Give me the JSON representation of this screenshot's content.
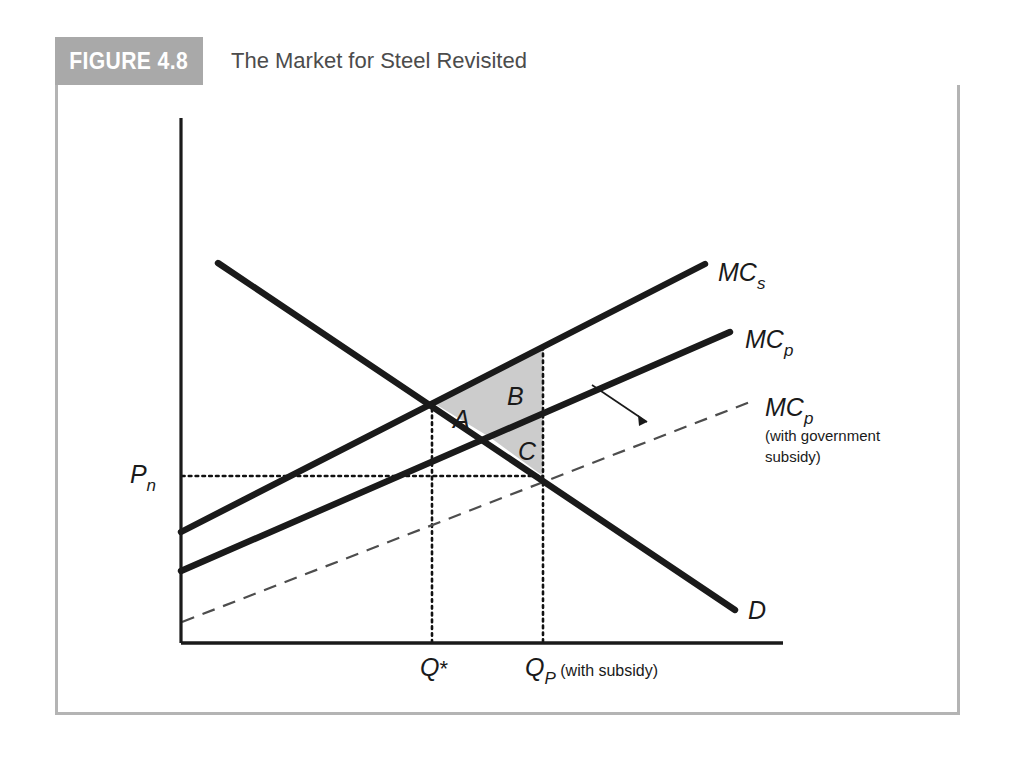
{
  "figure": {
    "number_label": "FIGURE 4.8",
    "title": "The Market for Steel Revisited"
  },
  "colors": {
    "header_box": "#a9a9a9",
    "title_text": "#4c4c4c",
    "frame_border": "#b4b4b4",
    "curve": "#1a1a1a",
    "shaded_region": "#cccccc",
    "dashed_curve": "#555555"
  },
  "axes": {
    "y_axis_label": "",
    "x_axis_label": "",
    "price_tick": {
      "label": "P",
      "subscript": "n"
    },
    "quantity_ticks": [
      {
        "label": "Q",
        "superscript": "*",
        "subscript": "",
        "note": ""
      },
      {
        "label": "Q",
        "superscript": "",
        "subscript": "P",
        "note": "(with subsidy)"
      }
    ]
  },
  "curves": [
    {
      "name": "marginal-social-cost",
      "label": "MC",
      "subscript": "s",
      "style": "solid",
      "note": ""
    },
    {
      "name": "marginal-private-cost",
      "label": "MC",
      "subscript": "p",
      "style": "solid",
      "note": ""
    },
    {
      "name": "marginal-private-cost-with-subsidy",
      "label": "MC",
      "subscript": "p",
      "style": "dashed",
      "note_line1": "(with government",
      "note_line2": "subsidy)"
    },
    {
      "name": "demand",
      "label": "D",
      "subscript": "",
      "style": "solid",
      "note": ""
    }
  ],
  "regions": [
    {
      "name": "region-a",
      "label": "A"
    },
    {
      "name": "region-b",
      "label": "B"
    },
    {
      "name": "region-c",
      "label": "C"
    }
  ],
  "chart_data": {
    "type": "line",
    "title": "The Market for Steel Revisited",
    "xlabel": "Quantity of steel",
    "ylabel": "Price / cost",
    "grid": false,
    "legend": "inline-curve-labels",
    "axis_origin_px": [
      126,
      558
    ],
    "series": [
      {
        "name": "MC_s (marginal social cost)",
        "label": "MC_s",
        "style": "solid",
        "points_px": [
          [
            126,
            447
          ],
          [
            650,
            179
          ]
        ]
      },
      {
        "name": "MC_p (marginal private cost)",
        "label": "MC_p",
        "style": "solid",
        "points_px": [
          [
            126,
            486
          ],
          [
            675,
            247
          ]
        ]
      },
      {
        "name": "MC_p with government subsidy",
        "label": "MC_p (with government subsidy)",
        "style": "dashed",
        "points_px": [
          [
            127,
            537
          ],
          [
            700,
            315
          ]
        ]
      },
      {
        "name": "D (demand)",
        "label": "D",
        "style": "solid",
        "points_px": [
          [
            163,
            178
          ],
          [
            680,
            525
          ]
        ]
      }
    ],
    "intersections": [
      {
        "name": "D x MC_s",
        "label": "Q*",
        "point_px": [
          377,
          317
        ]
      },
      {
        "name": "D x MC_p",
        "label": "Q_P",
        "point_px": [
          436,
          353
        ]
      }
    ],
    "reference_lines": [
      {
        "name": "Q* vertical",
        "orientation": "vertical",
        "x_px": 377,
        "style": "dotted"
      },
      {
        "name": "Q_P vertical",
        "orientation": "vertical",
        "x_px": 488,
        "style": "dotted"
      },
      {
        "name": "P_n horizontal",
        "orientation": "horizontal",
        "y_px": 391,
        "style": "dotted"
      }
    ],
    "shaded_regions": [
      {
        "label": "A",
        "centroid_px": [
          404,
          333
        ]
      },
      {
        "label": "B",
        "centroid_px": [
          458,
          311
        ]
      },
      {
        "label": "C",
        "centroid_px": [
          470,
          363
        ]
      }
    ],
    "annotations": [
      {
        "name": "subsidy-shift-arrow",
        "text": "",
        "from_px": [
          537,
          300
        ],
        "to_px": [
          596,
          340
        ]
      }
    ]
  }
}
